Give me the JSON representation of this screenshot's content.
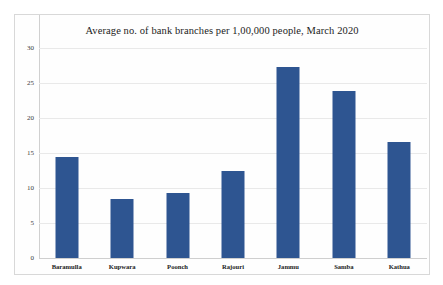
{
  "chart_data": {
    "type": "bar",
    "title": "Average no. of bank branches per 1,00,000 people, March 2020",
    "xlabel": "",
    "ylabel": "",
    "categories": [
      "Baramulla",
      "Kupwara",
      "Poonch",
      "Rajouri",
      "Jammu",
      "Samba",
      "Kathua"
    ],
    "values": [
      14.4,
      8.4,
      9.3,
      12.4,
      27.3,
      23.9,
      16.6
    ],
    "ylim": [
      0,
      30
    ],
    "yticks": [
      0,
      5,
      10,
      15,
      20,
      25,
      30
    ],
    "ytick_labels": [
      "0",
      "5",
      "10",
      "15",
      "20",
      "25",
      "30"
    ],
    "grid": true,
    "legend": false,
    "bar_color": "#2e5591",
    "gridline_color": "#e9e9e9",
    "border_color": "#d8d8d8"
  }
}
